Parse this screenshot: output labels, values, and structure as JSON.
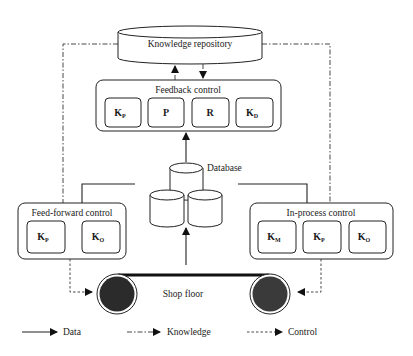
{
  "diagram": {
    "knowledge_repository": {
      "label": "Knowledge repository"
    },
    "feedback_control": {
      "title": "Feedback control",
      "items": [
        {
          "main": "K",
          "sub": "P"
        },
        {
          "main": "P",
          "sub": ""
        },
        {
          "main": "R",
          "sub": ""
        },
        {
          "main": "K",
          "sub": "D"
        }
      ]
    },
    "database": {
      "label": "Database"
    },
    "feed_forward_control": {
      "title": "Feed-forward control",
      "items": [
        {
          "main": "K",
          "sub": "P"
        },
        {
          "main": "K",
          "sub": "O"
        }
      ]
    },
    "in_process_control": {
      "title": "In-process control",
      "items": [
        {
          "main": "K",
          "sub": "M"
        },
        {
          "main": "K",
          "sub": "P"
        },
        {
          "main": "K",
          "sub": "O"
        }
      ]
    },
    "shop_floor": {
      "label": "Shop floor"
    },
    "legend": [
      {
        "style": "solid",
        "label": "Data"
      },
      {
        "style": "dash-dot",
        "label": "Knowledge"
      },
      {
        "style": "dashed",
        "label": "Control"
      }
    ]
  }
}
